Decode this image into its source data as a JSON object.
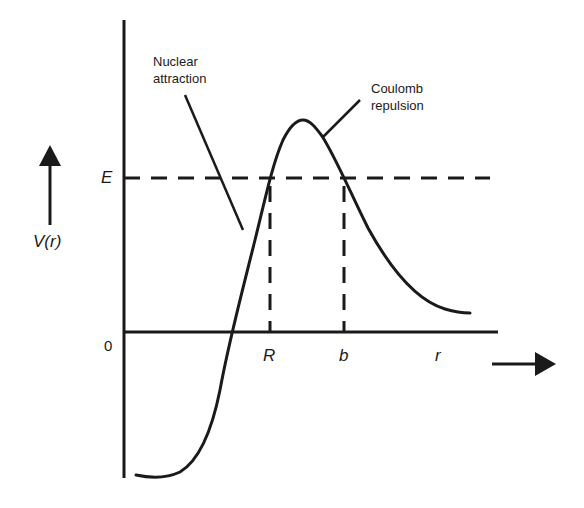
{
  "diagram": {
    "title": "",
    "y_axis_label": "V(r)",
    "x_axis_label": "r",
    "origin_label": "0",
    "energy_label": "E",
    "turning_points": [
      "R",
      "b"
    ],
    "annotations": {
      "nuclear": [
        "Nuclear",
        "attraction"
      ],
      "coulomb": [
        "Coulomb",
        "repulsion"
      ]
    },
    "colors": {
      "ink": "#1a1a1a",
      "background": "#ffffff"
    }
  }
}
